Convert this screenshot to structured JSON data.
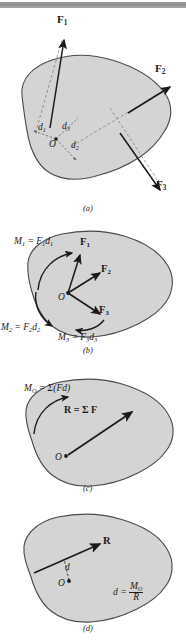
{
  "figure": {
    "page_edge_bar": "page-edge-bar",
    "blob_fill": "#d4d4d4",
    "blob_stroke": "#4a4a4a",
    "ink": "#1a1a1a"
  },
  "panels": [
    {
      "id": "a",
      "caption": "(a)",
      "labels": {
        "f1": "F",
        "f1_sub": "1",
        "f2": "F",
        "f2_sub": "2",
        "f3": "F",
        "f3_sub": "3",
        "d1": "d",
        "d1_sub": "1",
        "d2": "d",
        "d2_sub": "2",
        "d3": "d",
        "d3_sub": "3",
        "origin": "O"
      }
    },
    {
      "id": "b",
      "caption": "(b)",
      "labels": {
        "f1": "F",
        "f1_sub": "1",
        "f2": "F",
        "f2_sub": "2",
        "f3": "F",
        "f3_sub": "3",
        "m1": "M",
        "m1_sub": "1",
        "m1_eq": " = F",
        "m1_eq_sub": "1",
        "m1_d": "d",
        "m1_d_sub": "1",
        "m2": "M",
        "m2_sub": "2",
        "m2_eq": " = F",
        "m2_eq_sub": "2",
        "m2_d": "d",
        "m2_d_sub": "2",
        "m3": "M",
        "m3_sub": "3",
        "m3_eq": " = F",
        "m3_eq_sub": "3",
        "m3_d": "d",
        "m3_d_sub": "3",
        "origin": "O"
      }
    },
    {
      "id": "c",
      "caption": "(c)",
      "labels": {
        "mo": "M",
        "mo_sub": "O",
        "mo_eq": " = Σ(Fd)",
        "r": "R",
        "r_eq": " = Σ F",
        "origin": "O"
      }
    },
    {
      "id": "d",
      "caption": "(d)",
      "labels": {
        "r": "R",
        "d": "d",
        "origin": "O",
        "formula_lhs": "d = ",
        "formula_num": "M",
        "formula_num_sub": "O",
        "formula_den": "R"
      }
    }
  ]
}
